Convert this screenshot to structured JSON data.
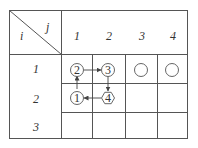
{
  "corner": {
    "row_var": "i",
    "col_var": "j"
  },
  "columns": [
    "1",
    "2",
    "3",
    "4"
  ],
  "rows": [
    "1",
    "2",
    "3"
  ],
  "nodes": [
    {
      "row": 1,
      "col": 1,
      "label": "2",
      "shape": "circle"
    },
    {
      "row": 1,
      "col": 2,
      "label": "3",
      "shape": "circle"
    },
    {
      "row": 1,
      "col": 3,
      "label": "",
      "shape": "circle"
    },
    {
      "row": 1,
      "col": 4,
      "label": "",
      "shape": "circle"
    },
    {
      "row": 2,
      "col": 1,
      "label": "1",
      "shape": "circle"
    },
    {
      "row": 2,
      "col": 2,
      "label": "4",
      "shape": "hexagon"
    }
  ],
  "arrows": [
    {
      "from": "1",
      "to": "2",
      "direction": "up"
    },
    {
      "from": "2",
      "to": "3",
      "direction": "right"
    },
    {
      "from": "3",
      "to": "4",
      "direction": "down"
    },
    {
      "from": "4",
      "to": "1",
      "direction": "left"
    }
  ]
}
